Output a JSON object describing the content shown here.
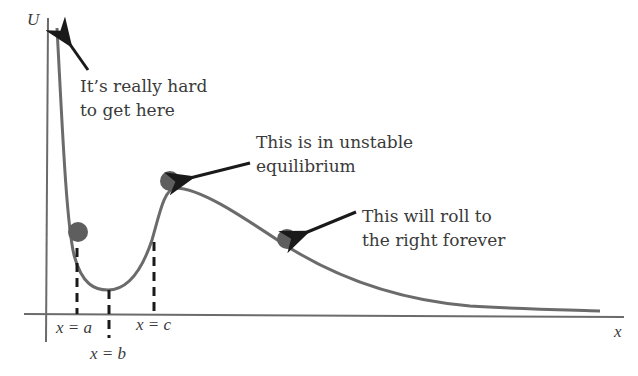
{
  "diagram": {
    "axes": {
      "y_label": "U",
      "x_label": "x"
    },
    "markers": [
      {
        "id": "a",
        "label": "x = a"
      },
      {
        "id": "b",
        "label": "x = b"
      },
      {
        "id": "c",
        "label": "x = c"
      }
    ],
    "annotations": [
      {
        "id": "hard",
        "lines": [
          "It’s really hard",
          "to get here"
        ]
      },
      {
        "id": "unstable",
        "lines": [
          "This is in unstable",
          "equilibrium"
        ]
      },
      {
        "id": "roll",
        "lines": [
          "This will roll to",
          "the right forever"
        ]
      }
    ],
    "colors": {
      "curve": "#6b6b6b",
      "axis": "#6b6b6b",
      "ball": "#5e5e5e",
      "arrow": "#1a1a1a",
      "text": "#3a3a3a"
    }
  }
}
